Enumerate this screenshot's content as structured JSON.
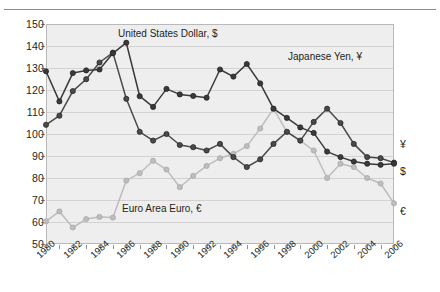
{
  "chart_data": {
    "type": "line",
    "title": "",
    "xlabel": "",
    "ylabel": "",
    "xlim": [
      1980,
      2006
    ],
    "ylim": [
      50,
      150
    ],
    "ytick_values": [
      50,
      60,
      70,
      80,
      90,
      100,
      110,
      120,
      130,
      140,
      150
    ],
    "ytick_labels": [
      "50",
      "60",
      "70",
      "80",
      "90",
      "100",
      "110",
      "120",
      "130",
      "140",
      "150"
    ],
    "x": [
      1980,
      1981,
      1982,
      1983,
      1984,
      1985,
      1986,
      1987,
      1988,
      1989,
      1990,
      1991,
      1992,
      1993,
      1994,
      1995,
      1996,
      1997,
      1998,
      1999,
      2000,
      2001,
      2002,
      2003,
      2004,
      2005,
      2006
    ],
    "xtick_values": [
      1980,
      1981,
      1982,
      1983,
      1984,
      1985,
      1986,
      1987,
      1988,
      1989,
      1990,
      1991,
      1992,
      1993,
      1994,
      1995,
      1996,
      1997,
      1998,
      1999,
      2000,
      2001,
      2002,
      2003,
      2004,
      2005,
      2006
    ],
    "xtick_labels": [
      "1980",
      "1982",
      "1984",
      "1986",
      "1988",
      "1990",
      "1992",
      "1994",
      "1996",
      "1998",
      "2000",
      "2002",
      "2004",
      "2006"
    ],
    "xtick_label_years": [
      1980,
      1982,
      1984,
      1986,
      1988,
      1990,
      1992,
      1994,
      1996,
      1998,
      2000,
      2002,
      2004,
      2006
    ],
    "grid": true,
    "grid_axis": "y",
    "legend": "inline-annotations",
    "series": [
      {
        "name": "United States Dollar, $",
        "symbol": "$",
        "color": "#4a4a4a",
        "marker": "circle",
        "values": [
          104.2,
          108.3,
          119.5,
          124.9,
          132.5,
          137.0,
          116.0,
          101.0,
          97.0,
          100.0,
          95.0,
          94.0,
          92.5,
          95.5,
          89.5,
          85.0,
          88.5,
          95.5,
          101.0,
          97.0,
          105.5,
          111.5,
          105.0,
          95.5,
          89.5,
          89.0,
          87.0
        ]
      },
      {
        "name": "Japanese Yen, ¥",
        "symbol": "¥",
        "color": "#3a3a3a",
        "marker": "circle",
        "values": [
          128.5,
          114.8,
          127.7,
          128.9,
          129.3,
          136.7,
          141.5,
          117.2,
          112.3,
          120.5,
          118.0,
          117.3,
          116.5,
          129.3,
          126.1,
          131.8,
          123.0,
          111.5,
          107.3,
          103.0,
          100.5,
          92.0,
          89.5,
          87.5,
          86.5,
          86.0,
          86.5
        ]
      },
      {
        "name": "Euro Area Euro, €",
        "symbol": "€",
        "color": "#bdbdbd",
        "marker": "circle",
        "values": [
          60.3,
          64.8,
          57.5,
          61.3,
          62.3,
          62.0,
          78.8,
          82.2,
          87.8,
          83.8,
          75.8,
          81.0,
          85.5,
          89.0,
          91.0,
          94.5,
          102.5,
          111.5,
          101.0,
          97.0,
          92.5,
          80.0,
          86.5,
          85.0,
          80.0,
          77.5,
          68.5
        ]
      }
    ],
    "annotations": [
      {
        "text": "United States Dollar, $",
        "series": "United States Dollar, $"
      },
      {
        "text": "Japanese Yen, ¥",
        "series": "Japanese Yen, ¥"
      },
      {
        "text": "Euro Area Euro, €",
        "series": "Euro Area Euro, €"
      }
    ],
    "end_labels": [
      "¥",
      "$",
      "€"
    ]
  }
}
